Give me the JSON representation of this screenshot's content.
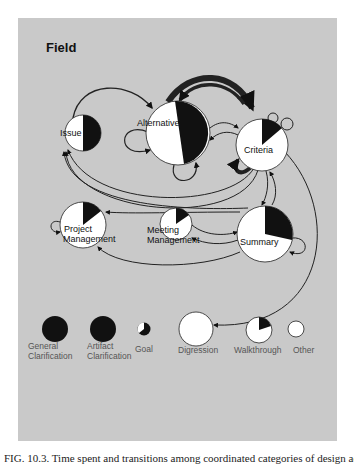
{
  "figure": {
    "title": "Field",
    "caption": "FIG. 10.3. Time spent and transitions among coordinated categories of design activity",
    "colors": {
      "panel": "#c9c9c9",
      "node_fill": "#ffffff",
      "wedge_fill": "#111111",
      "edge": "#222222"
    }
  },
  "nodes": [
    {
      "id": "issue",
      "label": "Issue",
      "cx": 83,
      "cy": 133,
      "r": 18,
      "black_fraction": 0.5
    },
    {
      "id": "alternative",
      "label": "Alternative",
      "cx": 178,
      "cy": 133,
      "r": 32,
      "black_fraction": 0.47
    },
    {
      "id": "criteria",
      "label": "Criteria",
      "cx": 262,
      "cy": 145,
      "r": 26,
      "black_fraction": 0.16
    },
    {
      "id": "project_management",
      "label_line1": "Project",
      "label_line2": "Management",
      "cx": 83,
      "cy": 225,
      "r": 23,
      "black_fraction": 0.17
    },
    {
      "id": "meeting_management",
      "label_line1": "Meeting",
      "label_line2": "Management",
      "cx": 176,
      "cy": 224,
      "r": 16,
      "black_fraction": 0.17
    },
    {
      "id": "summary",
      "label": "Summary",
      "cx": 265,
      "cy": 234,
      "r": 28,
      "black_fraction": 0.29
    }
  ],
  "legend": [
    {
      "id": "general_clarification",
      "line1": "General",
      "line2": "Clarification",
      "black_fraction": 1.0
    },
    {
      "id": "artifact_clarification",
      "line1": "Artifact",
      "line2": "Clarification",
      "black_fraction": 1.0
    },
    {
      "id": "goal",
      "line1": "Goal",
      "line2": "",
      "black_fraction": 0.6
    },
    {
      "id": "digression",
      "line1": "Digression",
      "line2": "",
      "black_fraction": 0.0
    },
    {
      "id": "walkthrough",
      "line1": "Walkthrough",
      "line2": "",
      "black_fraction": 0.17
    },
    {
      "id": "other",
      "line1": "Other",
      "line2": "",
      "black_fraction": 0.0
    }
  ]
}
